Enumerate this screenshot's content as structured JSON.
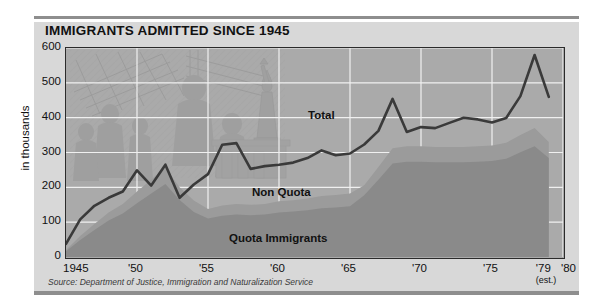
{
  "title": "IMMIGRANTS ADMITTED SINCE 1945",
  "source": "Source: Department of Justice, Immigration and Naturalization Service",
  "ylabel": "in thousands",
  "xaxis_end_label": "'80",
  "est_note": "(est.)",
  "colors": {
    "panel": "#d8d8d8",
    "plot_background": "#aaaaaa",
    "non_quota_area": "#9b9b9b",
    "quota_area": "#8a8a8a",
    "total_line": "#3a3a3a",
    "gridline": "#f0f0f0",
    "frame": "#2b2b2b",
    "rule": "#8e8e8e"
  },
  "chart_data": {
    "type": "area",
    "title": "IMMIGRANTS ADMITTED SINCE 1945",
    "subtitle": "",
    "xlabel": "",
    "ylabel": "in thousands",
    "ylim": [
      0,
      600
    ],
    "xlim": [
      1945,
      1980
    ],
    "grid": true,
    "legend": "in-plot labels",
    "ytick_labels": [
      "0",
      "100",
      "200",
      "300",
      "400",
      "500",
      "600"
    ],
    "ytick_values": [
      0,
      100,
      200,
      300,
      400,
      500,
      600
    ],
    "xtick_labels": [
      "1945",
      "'50",
      "'55",
      "'60",
      "'65",
      "'70",
      "'75",
      "'79",
      "'80"
    ],
    "xtick_values": [
      1945,
      1950,
      1955,
      1960,
      1965,
      1970,
      1975,
      1979,
      1980
    ],
    "annotations": [
      {
        "text": "Total",
        "x": 1961,
        "y": 390
      },
      {
        "text": "Non Quota",
        "x": 1960,
        "y": 170
      },
      {
        "text": "Quota Immigrants",
        "x": 1961,
        "y": 60
      },
      {
        "text": "(est.)",
        "x": 1979,
        "y": -60
      }
    ],
    "x": [
      1945,
      1946,
      1947,
      1948,
      1949,
      1950,
      1951,
      1952,
      1953,
      1954,
      1955,
      1956,
      1957,
      1958,
      1959,
      1960,
      1961,
      1962,
      1963,
      1964,
      1965,
      1966,
      1967,
      1968,
      1969,
      1970,
      1971,
      1972,
      1973,
      1974,
      1975,
      1976,
      1977,
      1978,
      1979
    ],
    "series": [
      {
        "name": "Total",
        "type": "line",
        "color": "#3a3a3a",
        "values": [
          38,
          108,
          147,
          170,
          188,
          249,
          205,
          265,
          170,
          208,
          238,
          322,
          327,
          253,
          261,
          265,
          271,
          284,
          306,
          292,
          297,
          323,
          362,
          454,
          359,
          373,
          370,
          385,
          400,
          395,
          386,
          399,
          462,
          580,
          460
        ]
      },
      {
        "name": "Non Quota",
        "type": "area",
        "color": "#9b9b9b",
        "note": "upper boundary of the stacked non-quota band",
        "values": [
          20,
          60,
          95,
          128,
          152,
          188,
          222,
          256,
          200,
          162,
          138,
          148,
          152,
          150,
          152,
          160,
          163,
          168,
          175,
          178,
          182,
          206,
          258,
          312,
          318,
          318,
          316,
          316,
          316,
          318,
          320,
          328,
          350,
          370,
          330
        ]
      },
      {
        "name": "Quota Immigrants",
        "type": "area",
        "color": "#8a8a8a",
        "note": "lower stacked band, from zero",
        "values": [
          20,
          60,
          95,
          128,
          152,
          188,
          222,
          256,
          200,
          162,
          138,
          148,
          152,
          150,
          152,
          160,
          163,
          168,
          175,
          178,
          182,
          206,
          258,
          312,
          318,
          318,
          316,
          316,
          316,
          318,
          320,
          328,
          350,
          370,
          330
        ]
      }
    ]
  }
}
